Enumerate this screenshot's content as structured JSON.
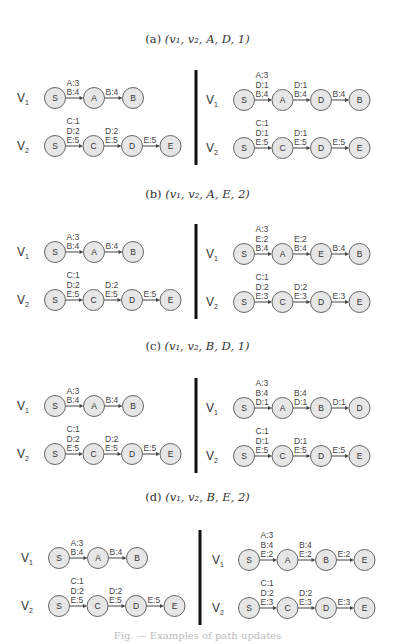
{
  "panels": [
    {
      "id": "a",
      "label": "(a)",
      "tuple": "(v₁, v₂, A, D, 1)",
      "title_y": 32,
      "panel_y": 60,
      "left": {
        "v1": {
          "nodes": [
            "S",
            "A",
            "B"
          ],
          "edges": [
            [
              "A:3",
              "B:4"
            ],
            [
              "B:4"
            ]
          ]
        },
        "v2": {
          "nodes": [
            "S",
            "C",
            "D",
            "E"
          ],
          "edges": [
            [
              "C:1",
              "D:2",
              "E:5"
            ],
            [
              "D:2",
              "E:5"
            ],
            [
              "E:5"
            ]
          ]
        }
      },
      "right": {
        "v1": {
          "nodes": [
            "S",
            "A",
            "D",
            "B"
          ],
          "edges": [
            [
              "A:3",
              "D:1",
              "B:4"
            ],
            [
              "D:1",
              "B:4"
            ],
            [
              "B:4"
            ]
          ]
        },
        "v2": {
          "nodes": [
            "S",
            "C",
            "D",
            "E"
          ],
          "edges": [
            [
              "C:1",
              "D:1",
              "E:5"
            ],
            [
              "D:1",
              "E:5"
            ],
            [
              "E:5"
            ]
          ]
        }
      }
    },
    {
      "id": "b",
      "label": "(b)",
      "tuple": "(v₁, v₂, A, E, 2)",
      "title_y": 187,
      "panel_y": 214,
      "left": {
        "v1": {
          "nodes": [
            "S",
            "A",
            "B"
          ],
          "edges": [
            [
              "A:3",
              "B:4"
            ],
            [
              "B:4"
            ]
          ]
        },
        "v2": {
          "nodes": [
            "S",
            "C",
            "D",
            "E"
          ],
          "edges": [
            [
              "C:1",
              "D:2",
              "E:5"
            ],
            [
              "D:2",
              "E:5"
            ],
            [
              "E:5"
            ]
          ]
        }
      },
      "right": {
        "v1": {
          "nodes": [
            "S",
            "A",
            "E",
            "B"
          ],
          "edges": [
            [
              "A:3",
              "E:2",
              "B:4"
            ],
            [
              "E:2",
              "B:4"
            ],
            [
              "B:4"
            ]
          ]
        },
        "v2": {
          "nodes": [
            "S",
            "C",
            "D",
            "E"
          ],
          "edges": [
            [
              "C:1",
              "D:2",
              "E:3"
            ],
            [
              "D:2",
              "E:3"
            ],
            [
              "E:3"
            ]
          ]
        }
      }
    },
    {
      "id": "c",
      "label": "(c)",
      "tuple": "(v₁, v₂, B, D, 1)",
      "title_y": 339,
      "panel_y": 368,
      "left": {
        "v1": {
          "nodes": [
            "S",
            "A",
            "B"
          ],
          "edges": [
            [
              "A:3",
              "B:4"
            ],
            [
              "B:4"
            ]
          ]
        },
        "v2": {
          "nodes": [
            "S",
            "C",
            "D",
            "E"
          ],
          "edges": [
            [
              "C:1",
              "D:2",
              "E:5"
            ],
            [
              "D:2",
              "E:5"
            ],
            [
              "E:5"
            ]
          ]
        }
      },
      "right": {
        "v1": {
          "nodes": [
            "S",
            "A",
            "B",
            "D"
          ],
          "edges": [
            [
              "A:3",
              "B:4",
              "D:1"
            ],
            [
              "B:4",
              "D:1"
            ],
            [
              "D:1"
            ]
          ]
        },
        "v2": {
          "nodes": [
            "S",
            "C",
            "D",
            "E"
          ],
          "edges": [
            [
              "C:1",
              "D:1",
              "E:5"
            ],
            [
              "D:1",
              "E:5"
            ],
            [
              "E:5"
            ]
          ]
        }
      }
    },
    {
      "id": "d",
      "label": "(d)",
      "tuple": "(v₁, v₂, B, E, 2)",
      "title_y": 490,
      "panel_y": 520,
      "left": {
        "v1": {
          "nodes": [
            "S",
            "A",
            "B"
          ],
          "edges": [
            [
              "A:3",
              "B:4"
            ],
            [
              "B:4"
            ]
          ]
        },
        "v2": {
          "nodes": [
            "S",
            "C",
            "D",
            "E"
          ],
          "edges": [
            [
              "C:1",
              "D:2",
              "E:5"
            ],
            [
              "D:2",
              "E:5"
            ],
            [
              "E:5"
            ]
          ]
        }
      },
      "right": {
        "v1": {
          "nodes": [
            "S",
            "A",
            "B",
            "E"
          ],
          "edges": [
            [
              "A:3",
              "B:4",
              "E:2"
            ],
            [
              "B:4",
              "E:2"
            ],
            [
              "E:2"
            ]
          ]
        },
        "v2": {
          "nodes": [
            "S",
            "C",
            "D",
            "E"
          ],
          "edges": [
            [
              "C:1",
              "D:2",
              "E:3"
            ],
            [
              "D:2",
              "E:3"
            ],
            [
              "E:3"
            ]
          ]
        }
      }
    }
  ],
  "row_labels": {
    "v1": "V",
    "v1_sub": "1",
    "v2": "V",
    "v2_sub": "2"
  },
  "caption": "Fig. — Examples of path updates"
}
